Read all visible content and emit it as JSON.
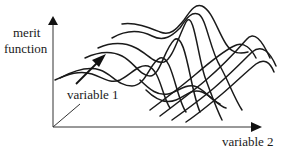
{
  "diagram": {
    "type": "3d-surface-illustration",
    "axes": {
      "vertical": {
        "label_line1": "merit",
        "label_line2": "function"
      },
      "depth": {
        "label": "variable 1"
      },
      "horizontal": {
        "label": "variable 2"
      }
    },
    "colors": {
      "line": "#1a1a1a",
      "axis": "#333333",
      "background": "#ffffff"
    }
  }
}
